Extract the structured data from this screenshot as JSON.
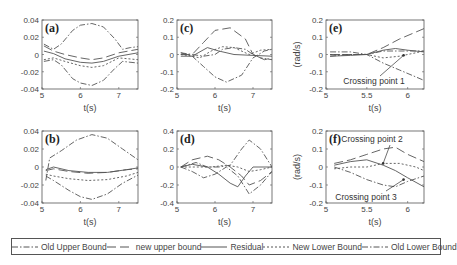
{
  "chart_data": [
    {
      "id": "a",
      "panel_label": "(a)",
      "type": "line",
      "xlabel": "t(s)",
      "ylabel": "",
      "xlim": [
        5,
        7.5
      ],
      "ylim": [
        -0.04,
        0.04
      ],
      "xticks": [
        "5",
        "6",
        "7"
      ],
      "yticks": [
        "0.04",
        "0.02",
        "0",
        "-0.02",
        "-0.04"
      ],
      "series": [
        {
          "name": "Old Upper Bound",
          "x": [
            5.05,
            5.3,
            5.5,
            5.8,
            6.0,
            6.3,
            6.6,
            6.9,
            7.1,
            7.3,
            7.5
          ],
          "y": [
            0.012,
            0.006,
            0.012,
            0.028,
            0.034,
            0.036,
            0.032,
            0.018,
            0.006,
            0.008,
            0.009
          ]
        },
        {
          "name": "new upper bound",
          "x": [
            5.05,
            5.3,
            5.6,
            6.0,
            6.3,
            6.6,
            7.0,
            7.5
          ],
          "y": [
            0.01,
            0.004,
            0.0,
            -0.004,
            -0.006,
            -0.004,
            0.002,
            0.006
          ]
        },
        {
          "name": "Residual",
          "x": [
            5.05,
            5.3,
            5.6,
            6.0,
            6.3,
            6.6,
            7.0,
            7.5
          ],
          "y": [
            0.004,
            0.001,
            -0.005,
            -0.009,
            -0.01,
            -0.008,
            -0.002,
            0.002
          ]
        },
        {
          "name": "New Lower Bound",
          "x": [
            5.05,
            5.3,
            5.6,
            6.0,
            6.3,
            6.6,
            7.0,
            7.5
          ],
          "y": [
            -0.006,
            -0.004,
            -0.008,
            -0.013,
            -0.015,
            -0.013,
            -0.004,
            -0.006
          ]
        },
        {
          "name": "Old Lower Bound",
          "x": [
            5.05,
            5.3,
            5.5,
            5.8,
            6.0,
            6.3,
            6.6,
            6.9,
            7.1,
            7.5
          ],
          "y": [
            -0.008,
            -0.006,
            -0.012,
            -0.028,
            -0.033,
            -0.036,
            -0.03,
            -0.016,
            -0.008,
            -0.01
          ]
        }
      ]
    },
    {
      "id": "b",
      "panel_label": "(b)",
      "type": "line",
      "xlabel": "t(s)",
      "ylabel": "",
      "xlim": [
        5,
        7.5
      ],
      "ylim": [
        -0.04,
        0.04
      ],
      "xticks": [
        "5",
        "6",
        "7"
      ],
      "yticks": [
        "0.04",
        "0.02",
        "0",
        "-0.02",
        "-0.04"
      ],
      "series": [
        {
          "name": "Old Upper Bound",
          "x": [
            5.1,
            5.2,
            5.5,
            5.9,
            6.3,
            6.7,
            7.1,
            7.5
          ],
          "y": [
            -0.015,
            0.01,
            0.018,
            0.03,
            0.036,
            0.032,
            0.02,
            0.008
          ]
        },
        {
          "name": "new upper bound",
          "x": [
            5.1,
            5.3,
            5.7,
            6.2,
            6.7,
            7.2,
            7.5
          ],
          "y": [
            -0.004,
            -0.002,
            -0.005,
            -0.007,
            -0.006,
            -0.003,
            -0.002
          ]
        },
        {
          "name": "Residual",
          "x": [
            5.1,
            5.3,
            5.7,
            6.2,
            6.7,
            7.2,
            7.5
          ],
          "y": [
            -0.003,
            0.0,
            -0.004,
            -0.006,
            -0.006,
            -0.003,
            -0.001
          ]
        },
        {
          "name": "New Lower Bound",
          "x": [
            5.1,
            5.3,
            5.7,
            6.2,
            6.7,
            7.2,
            7.5
          ],
          "y": [
            -0.008,
            -0.01,
            -0.013,
            -0.015,
            -0.014,
            -0.01,
            -0.006
          ]
        },
        {
          "name": "Old Lower Bound",
          "x": [
            5.1,
            5.3,
            5.7,
            6.0,
            6.3,
            6.7,
            7.1,
            7.5
          ],
          "y": [
            -0.01,
            -0.015,
            -0.026,
            -0.033,
            -0.036,
            -0.03,
            -0.018,
            -0.009
          ]
        }
      ]
    },
    {
      "id": "c",
      "panel_label": "(c)",
      "type": "line",
      "xlabel": "t(s)",
      "ylabel": "",
      "xlim": [
        5,
        7.5
      ],
      "ylim": [
        -0.2,
        0.2
      ],
      "xticks": [
        "5",
        "6",
        "7"
      ],
      "yticks": [
        "0.2",
        "0.1",
        "0",
        "-0.1",
        "-0.2"
      ],
      "series": [
        {
          "name": "Old Upper Bound",
          "x": [
            5.1,
            5.4,
            5.7,
            6.0,
            6.2,
            6.5,
            6.8,
            7.0,
            7.2,
            7.5
          ],
          "y": [
            0.01,
            0.0,
            -0.01,
            0.0,
            0.03,
            0.04,
            0.03,
            0.0,
            -0.02,
            -0.03
          ]
        },
        {
          "name": "new upper bound",
          "x": [
            5.1,
            5.4,
            5.7,
            6.0,
            6.4,
            6.8,
            7.0,
            7.3,
            7.5
          ],
          "y": [
            0.0,
            0.0,
            0.07,
            0.14,
            0.155,
            0.09,
            0.0,
            -0.03,
            -0.02
          ]
        },
        {
          "name": "Residual",
          "x": [
            5.1,
            5.4,
            5.8,
            6.1,
            6.5,
            7.0,
            7.5
          ],
          "y": [
            -0.01,
            -0.01,
            0.04,
            0.02,
            0.0,
            -0.005,
            -0.01
          ]
        },
        {
          "name": "New Lower Bound",
          "x": [
            5.1,
            5.4,
            5.6,
            5.9,
            6.2,
            6.5,
            6.9,
            7.2,
            7.5
          ],
          "y": [
            0.0,
            -0.01,
            -0.02,
            0.02,
            0.045,
            0.04,
            0.0,
            0.025,
            0.03
          ]
        },
        {
          "name": "Old Lower Bound",
          "x": [
            5.1,
            5.4,
            5.7,
            6.0,
            6.3,
            6.7,
            7.0,
            7.3,
            7.5
          ],
          "y": [
            0.01,
            -0.01,
            -0.07,
            -0.13,
            -0.16,
            -0.12,
            -0.02,
            0.02,
            0.03
          ]
        }
      ]
    },
    {
      "id": "d",
      "panel_label": "(d)",
      "type": "line",
      "xlabel": "t(s)",
      "ylabel": "",
      "xlim": [
        5,
        7.5
      ],
      "ylim": [
        -0.4,
        0.4
      ],
      "xticks": [
        "5",
        "6",
        "7"
      ],
      "yticks": [
        "0.4",
        "0.2",
        "0",
        "-0.2",
        "-0.4"
      ],
      "series": [
        {
          "name": "Old Upper Bound",
          "x": [
            5.1,
            5.5,
            5.8,
            6.1,
            6.4,
            6.7,
            6.9,
            7.2,
            7.5
          ],
          "y": [
            0.0,
            0.05,
            0.0,
            0.0,
            0.02,
            0.2,
            0.3,
            0.2,
            0.0
          ]
        },
        {
          "name": "new upper bound",
          "x": [
            5.1,
            5.4,
            5.8,
            6.1,
            6.4,
            6.7,
            6.9,
            7.2,
            7.5
          ],
          "y": [
            0.0,
            0.08,
            0.12,
            0.08,
            0.0,
            -0.1,
            -0.2,
            -0.15,
            -0.05
          ]
        },
        {
          "name": "Residual",
          "x": [
            5.1,
            5.4,
            5.8,
            6.1,
            6.4,
            6.6,
            6.8,
            7.0,
            7.5
          ],
          "y": [
            0.0,
            0.03,
            0.0,
            -0.08,
            -0.18,
            -0.22,
            -0.1,
            0.0,
            0.0
          ]
        },
        {
          "name": "New Lower Bound",
          "x": [
            5.1,
            5.5,
            5.9,
            6.3,
            6.6,
            6.9,
            7.2,
            7.5
          ],
          "y": [
            0.0,
            0.0,
            0.0,
            0.02,
            0.0,
            -0.05,
            -0.03,
            0.0
          ]
        },
        {
          "name": "Old Lower Bound",
          "x": [
            5.1,
            5.4,
            5.7,
            6.0,
            6.3,
            6.6,
            6.9,
            7.2,
            7.5
          ],
          "y": [
            0.0,
            -0.05,
            -0.12,
            -0.08,
            0.0,
            -0.1,
            -0.3,
            -0.2,
            -0.05
          ]
        }
      ]
    },
    {
      "id": "e",
      "panel_label": "(e)",
      "type": "line",
      "xlabel": "t(s)",
      "ylabel": "(rad/s)",
      "xlim": [
        5,
        6.2
      ],
      "ylim": [
        -0.2,
        0.2
      ],
      "xticks": [
        "5",
        "5.5",
        "6"
      ],
      "yticks": [
        "0.2",
        "0.1",
        "0",
        "-0.1",
        "-0.2"
      ],
      "annotations": [
        {
          "text": "Crossing point 1",
          "x": 5.95,
          "y": -0.005
        }
      ],
      "series": [
        {
          "name": "Old Upper Bound",
          "x": [
            5.05,
            5.3,
            5.5,
            5.7,
            5.9,
            6.1,
            6.2
          ],
          "y": [
            0.015,
            0.015,
            0.0,
            0.02,
            0.02,
            0.02,
            0.02
          ]
        },
        {
          "name": "new upper bound",
          "x": [
            5.05,
            5.3,
            5.5,
            5.7,
            5.9,
            6.1,
            6.2
          ],
          "y": [
            0.0,
            0.0,
            0.0,
            0.04,
            0.09,
            0.13,
            0.15
          ]
        },
        {
          "name": "Residual",
          "x": [
            5.05,
            5.3,
            5.5,
            5.7,
            5.85,
            6.0,
            6.2
          ],
          "y": [
            -0.01,
            -0.005,
            0.0,
            0.025,
            0.035,
            0.025,
            0.015
          ]
        },
        {
          "name": "New Lower Bound",
          "x": [
            5.05,
            5.3,
            5.5,
            5.7,
            5.9,
            6.1,
            6.2
          ],
          "y": [
            0.0,
            0.0,
            0.0,
            -0.02,
            -0.01,
            0.01,
            0.02
          ]
        },
        {
          "name": "Old Lower Bound",
          "x": [
            5.05,
            5.3,
            5.5,
            5.7,
            5.9,
            6.1,
            6.2
          ],
          "y": [
            -0.01,
            0.0,
            0.0,
            -0.05,
            -0.09,
            -0.13,
            -0.15
          ]
        }
      ]
    },
    {
      "id": "f",
      "panel_label": "(f)",
      "type": "line",
      "xlabel": "t(s)",
      "ylabel": "(rad/s)",
      "xlim": [
        5,
        6.2
      ],
      "ylim": [
        -0.2,
        0.2
      ],
      "xticks": [
        "5",
        "5.5",
        "6"
      ],
      "yticks": [
        "0.2",
        "0.1",
        "0",
        "-0.1",
        "-0.2"
      ],
      "annotations": [
        {
          "text": "Crossing point 2",
          "x": 5.7,
          "y": 0.02
        },
        {
          "text": "Crossing point 3",
          "x": 5.95,
          "y": -0.07
        }
      ],
      "series": [
        {
          "name": "new upper bound",
          "x": [
            5.1,
            5.3,
            5.5,
            5.7,
            5.85,
            6.0,
            6.2
          ],
          "y": [
            0.02,
            0.04,
            0.07,
            0.1,
            0.11,
            0.07,
            0.03
          ]
        },
        {
          "name": "Residual",
          "x": [
            5.1,
            5.3,
            5.5,
            5.7,
            5.85,
            6.0,
            6.2
          ],
          "y": [
            0.01,
            0.03,
            0.04,
            0.01,
            -0.02,
            -0.06,
            -0.11
          ]
        },
        {
          "name": "New Lower Bound",
          "x": [
            5.1,
            5.3,
            5.5,
            5.7,
            5.9,
            6.1,
            6.2
          ],
          "y": [
            -0.01,
            0.0,
            0.0,
            0.02,
            0.02,
            0.0,
            -0.02
          ]
        },
        {
          "name": "Old Lower Bound",
          "x": [
            5.1,
            5.3,
            5.5,
            5.7,
            5.85,
            6.0,
            6.2
          ],
          "y": [
            0.0,
            -0.03,
            -0.07,
            -0.1,
            -0.11,
            -0.08,
            -0.05
          ]
        }
      ]
    }
  ],
  "legend": {
    "items": [
      {
        "label": "Old Upper Bound",
        "dash": "6,2,1.5,2"
      },
      {
        "label": "new upper bound",
        "dash": "9,4"
      },
      {
        "label": "Residual",
        "dash": ""
      },
      {
        "label": "New Lower Bound",
        "dash": "2,2"
      },
      {
        "label": "Old Lower Bound",
        "dash": "6,2,1.5,2"
      }
    ]
  }
}
